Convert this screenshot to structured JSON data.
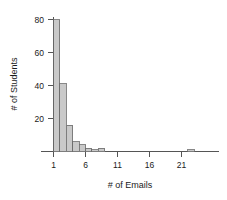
{
  "chart_data": {
    "type": "bar",
    "title": "",
    "xlabel": "# of Emails",
    "ylabel": "# of Students",
    "xlim": [
      0,
      23.5
    ],
    "ylim": [
      0,
      84
    ],
    "grid": false,
    "legend": null,
    "bin_width": 1,
    "x_ticks": [
      1,
      6,
      11,
      16,
      21
    ],
    "x_tick_labels": [
      "1",
      "6",
      "11",
      "16",
      "21"
    ],
    "y_ticks": [
      20,
      40,
      60,
      80
    ],
    "y_tick_labels": [
      "20",
      "40",
      "60",
      "80"
    ],
    "categories": [
      1,
      2,
      3,
      4,
      5,
      6,
      7,
      8,
      9,
      22
    ],
    "values": [
      80,
      41,
      16,
      6,
      4,
      2,
      1,
      2,
      0,
      1
    ],
    "bars": [
      {
        "x": 1,
        "value": 80
      },
      {
        "x": 2,
        "value": 41
      },
      {
        "x": 3,
        "value": 16
      },
      {
        "x": 4,
        "value": 6
      },
      {
        "x": 5,
        "value": 4
      },
      {
        "x": 6,
        "value": 2
      },
      {
        "x": 7,
        "value": 1
      },
      {
        "x": 8,
        "value": 2
      },
      {
        "x": 22,
        "value": 1
      }
    ],
    "bar_fill_color": "#c9c9c9",
    "bar_stroke_color": "#6a6a6a",
    "axis_color": "#555555"
  }
}
